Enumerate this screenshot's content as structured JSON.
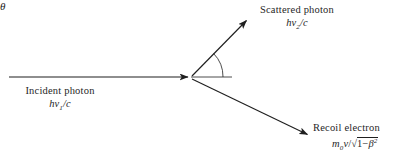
{
  "figure": {
    "title_semantic": "compton-scattering-diagram",
    "background_color": "#ffffff",
    "stroke_color": "#1f1f1f",
    "width": 397,
    "height": 163
  },
  "labels": {
    "incident": {
      "name": "Incident photon",
      "formula_prefix": "h",
      "formula_symbol": "ν",
      "formula_subscript": "1",
      "formula_suffix": "/c",
      "formula_full": "hν₁/c"
    },
    "scattered": {
      "name": "Scattered photon",
      "formula_prefix": "h",
      "formula_symbol": "ν",
      "formula_subscript": "2",
      "formula_suffix": "/c",
      "formula_full": "hν₂/c"
    },
    "recoil": {
      "name": "Recoil electron",
      "formula_mass": "m",
      "formula_mass_subscript": "0",
      "formula_velocity": "v",
      "formula_divide": "/",
      "formula_radical": "√",
      "formula_radicand_prefix": "1−",
      "formula_radicand_symbol": "β",
      "formula_radicand_power": "2",
      "formula_full": "m₀v/√(1−β²)"
    },
    "angle": {
      "symbol": "θ"
    }
  },
  "geometry": {
    "vertex": {
      "x": 190,
      "y": 77
    },
    "incident_ray": {
      "x1": 9,
      "y1": 77,
      "x2": 190,
      "y2": 77,
      "arrow": "end"
    },
    "scattered_ray": {
      "x1": 192,
      "y1": 76,
      "x2": 248,
      "y2": 19,
      "arrow": "end"
    },
    "recoil_ray": {
      "x1": 192,
      "y1": 79,
      "x2": 310,
      "y2": 136,
      "arrow": "end"
    },
    "reference_line": {
      "x1": 191,
      "y1": 77,
      "x2": 232,
      "y2": 77
    },
    "angle_arc": {
      "cx": 190,
      "cy": 77,
      "radius": 33,
      "start_deg": 0,
      "end_deg": 45
    }
  }
}
